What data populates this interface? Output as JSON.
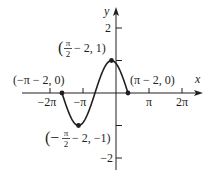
{
  "chart_data": {
    "type": "line",
    "title": "",
    "function": "y = sin(x + 2)",
    "xlabel": "x",
    "ylabel": "y",
    "x_ticks": [
      {
        "value": -6.283185,
        "label": "−2π"
      },
      {
        "value": -3.141593,
        "label": "−π"
      },
      {
        "value": 3.141593,
        "label": "π"
      },
      {
        "value": 6.283185,
        "label": "2π"
      }
    ],
    "y_ticks": [
      {
        "value": 2,
        "label": "2"
      },
      {
        "value": 1,
        "label": ""
      },
      {
        "value": -1,
        "label": ""
      },
      {
        "value": -2,
        "label": "−2"
      }
    ],
    "xlim": [
      -6.9,
      8.2
    ],
    "ylim": [
      -2.4,
      2.6
    ],
    "grid": false,
    "legend": null,
    "series": [
      {
        "name": "sin(x+2)",
        "domain": [
          -5.141593,
          1.141593
        ]
      }
    ],
    "points": [
      {
        "x": -5.141593,
        "y": 0,
        "label_paren_open": "(",
        "label_main": "−π − 2, 0",
        "label_paren_close": ")"
      },
      {
        "x": -3.570796,
        "y": -1,
        "label": "(−π/2 − 2, −1)"
      },
      {
        "x": -0.429204,
        "y": 1,
        "label": "(π/2 − 2, 1)"
      },
      {
        "x": 1.141593,
        "y": 0,
        "label": "(π − 2, 0)"
      }
    ],
    "annotations": [
      {
        "text": "(−π − 2, 0)",
        "near_point": 0
      },
      {
        "text": "(−π/2 − 2, −1)",
        "near_point": 1
      },
      {
        "text": "(π/2 − 2, 1)",
        "near_point": 2
      },
      {
        "text": "(π − 2, 0)",
        "near_point": 3
      }
    ]
  },
  "labels": {
    "x_axis": "x",
    "y_axis": "y",
    "tick_neg2pi": "−2π",
    "tick_negpi": "−π",
    "tick_pi": "π",
    "tick_2pi": "2π",
    "tick_y2": "2",
    "tick_yneg2": "−2",
    "pt_left_zero": "(−π − 2, 0)",
    "pt_right_zero": "(π − 2, 0)",
    "pt_max_open": "(",
    "pt_max_pi": "π",
    "pt_max_two": "2",
    "pt_max_rest": "− 2, 1)",
    "pt_min_open": "(−",
    "pt_min_pi": "π",
    "pt_min_two": "2",
    "pt_min_rest": "− 2, −1)"
  }
}
